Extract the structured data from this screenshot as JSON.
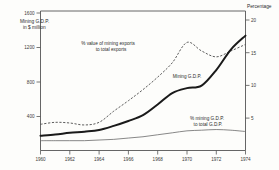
{
  "chart_data": {
    "type": "line",
    "title": "",
    "subtitle": "",
    "xlabel": "",
    "ylabel": "Mining G.D.P.\nin $ million",
    "y_left_axis_title_line1": "Mining G.D.P.",
    "y_left_axis_title_line2": "in $ million",
    "y_right_axis_title": "Percentage",
    "grid": false,
    "legend_position": "inline-annotations",
    "x": [
      1960,
      1961,
      1962,
      1963,
      1964,
      1965,
      1966,
      1967,
      1968,
      1969,
      1970,
      1971,
      1972,
      1973,
      1974
    ],
    "x_ticks": [
      "1960",
      "1962",
      "1964",
      "1966",
      "1968",
      "1970",
      "1972",
      "1974"
    ],
    "x_tick_values": [
      1960,
      1962,
      1964,
      1966,
      1968,
      1970,
      1972,
      1974
    ],
    "xlim": [
      1960,
      1974
    ],
    "y_left_ticks": [
      "400",
      "800",
      "1200",
      "1600"
    ],
    "y_left_tick_values": [
      400,
      800,
      1200,
      1600
    ],
    "ylim_left": [
      0,
      1700
    ],
    "y_right_ticks": [
      "5",
      "10",
      "15",
      "20"
    ],
    "y_right_tick_values": [
      5,
      10,
      15,
      20
    ],
    "ylim_right": [
      0,
      21.3
    ],
    "series": [
      {
        "name": "Mining G.D.P.",
        "style": "solid-thick",
        "axis": "left",
        "units": "$ million",
        "annotation": "Mining G.D.P.",
        "values": [
          180,
          195,
          215,
          230,
          250,
          300,
          360,
          430,
          560,
          700,
          760,
          790,
          980,
          1230,
          1400
        ]
      },
      {
        "name": "% value of mining exports to total exports",
        "style": "dashed",
        "axis": "right",
        "units": "percent",
        "annotation_line1": "% value of mining exports",
        "annotation_line2": "to total exports",
        "values": [
          4.0,
          4.3,
          4.2,
          3.9,
          4.3,
          6.0,
          7.6,
          9.3,
          11.2,
          13.4,
          16.5,
          15.2,
          14.3,
          15.2,
          16.2
        ]
      },
      {
        "name": "% mining G.D.P. to total G.D.P.",
        "style": "thin-solid",
        "axis": "right",
        "units": "percent",
        "annotation_line1": "% mining G.D.P.",
        "annotation_line2": "to total G.D.P.",
        "values": [
          1.5,
          1.5,
          1.5,
          1.5,
          1.6,
          1.7,
          1.9,
          2.1,
          2.4,
          2.7,
          3.0,
          3.1,
          3.2,
          3.1,
          2.9
        ]
      }
    ]
  },
  "axes": {
    "left": {
      "title_line1": "Mining G.D.P.",
      "title_line2": "in $ million",
      "ticks": [
        {
          "label": "1600",
          "value": 1600
        },
        {
          "label": "1200",
          "value": 1200
        },
        {
          "label": "800",
          "value": 800
        },
        {
          "label": "400",
          "value": 400
        }
      ]
    },
    "right": {
      "title": "Percentage",
      "ticks": [
        {
          "label": "20",
          "value": 20
        },
        {
          "label": "15",
          "value": 15
        },
        {
          "label": "10",
          "value": 10
        },
        {
          "label": "5",
          "value": 5
        }
      ]
    },
    "bottom": {
      "ticks": [
        {
          "label": "1960",
          "value": 1960
        },
        {
          "label": "1962",
          "value": 1962
        },
        {
          "label": "1964",
          "value": 1964
        },
        {
          "label": "1966",
          "value": 1966
        },
        {
          "label": "1968",
          "value": 1968
        },
        {
          "label": "1970",
          "value": 1970
        },
        {
          "label": "1972",
          "value": 1972
        },
        {
          "label": "1974",
          "value": 1974
        }
      ]
    }
  },
  "annotations": {
    "exports_line1": "% value of mining exports",
    "exports_line2": "to total exports",
    "mining_gdp": "Mining G.D.P.",
    "share_line1": "% mining G.D.P.",
    "share_line2": "to total G.D.P."
  },
  "colors": {
    "background": "#fdfdfb",
    "axis": "#555555",
    "mining_gdp_line": "#1a1a1a",
    "exports_line": "#4a4a4a",
    "share_line": "#6a6a6a",
    "text": "#2b2b2b"
  }
}
